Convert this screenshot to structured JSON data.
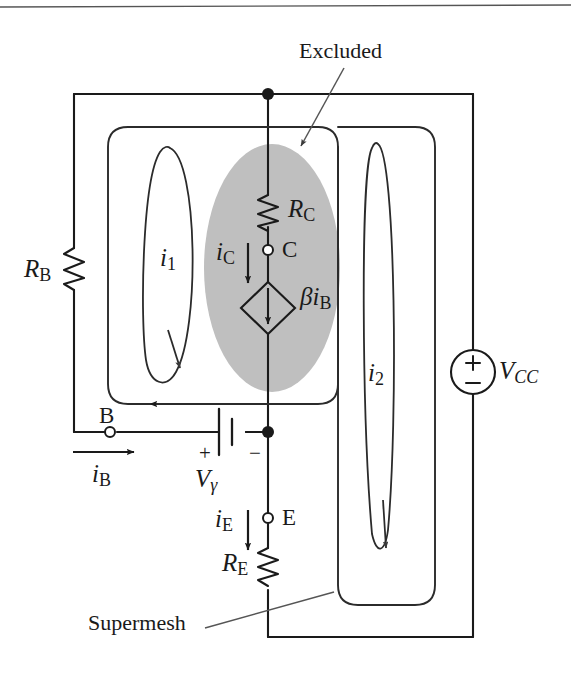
{
  "figure": {
    "title_annotations": {
      "excluded": "Excluded",
      "supermesh": "Supermesh"
    },
    "colors": {
      "wire": "#1a1a1a",
      "excluded_region_fill": "#bfbfbf",
      "background": "#ffffff",
      "top_rule": "#555555"
    },
    "components": [
      {
        "id": "rb",
        "label": "R",
        "sub": "B",
        "type": "resistor",
        "orientation": "vertical"
      },
      {
        "id": "rc",
        "label": "R",
        "sub": "C",
        "type": "resistor",
        "orientation": "vertical"
      },
      {
        "id": "re",
        "label": "R",
        "sub": "E",
        "type": "resistor",
        "orientation": "vertical"
      },
      {
        "id": "vcc",
        "label": "V",
        "sub": "CC",
        "type": "independent-voltage-source",
        "plus": "+",
        "minus": "−"
      },
      {
        "id": "vgamma",
        "label": "V",
        "sub": "γ",
        "type": "battery",
        "plus": "+",
        "minus": "−"
      },
      {
        "id": "beta-ib",
        "label": "βi",
        "sub": "B",
        "type": "dependent-current-source"
      }
    ],
    "terminals": [
      {
        "id": "b",
        "label": "B"
      },
      {
        "id": "c",
        "label": "C"
      },
      {
        "id": "e",
        "label": "E"
      }
    ],
    "currents": [
      {
        "id": "ib",
        "label": "i",
        "sub": "B",
        "direction": "right"
      },
      {
        "id": "ic",
        "label": "i",
        "sub": "C",
        "direction": "down"
      },
      {
        "id": "ie",
        "label": "i",
        "sub": "E",
        "direction": "down"
      }
    ],
    "mesh_currents": [
      {
        "id": "i1",
        "label": "i",
        "sub": "1",
        "direction": "clockwise"
      },
      {
        "id": "i2",
        "label": "i",
        "sub": "2",
        "direction": "clockwise"
      }
    ]
  }
}
